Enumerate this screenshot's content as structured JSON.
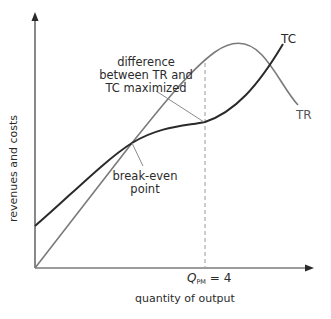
{
  "diagram": {
    "type": "economics-profit-maximization",
    "axes": {
      "y_label": "revenues and costs",
      "x_label": "quantity of output"
    },
    "curves": {
      "tc": {
        "label": "TC",
        "color": "#2a2a2a"
      },
      "tr": {
        "label": "TR",
        "color": "#7a7a7a"
      }
    },
    "annotations": {
      "max_diff": {
        "line1": "difference",
        "line2": "between TR and",
        "line3": "TC maximized"
      },
      "break_even": {
        "line1": "break-even",
        "line2": "point"
      },
      "q_marker": {
        "symbol": "Q",
        "subscript": "PM",
        "value_text": "= 4"
      }
    },
    "colors": {
      "axis": "#3a3a3a",
      "tc_curve": "#2a2a2a",
      "tr_curve": "#7a7a7a",
      "dashed_line": "#9a9a9a",
      "leader_lines": "#8a8a8a",
      "text": "#2b2b2b"
    }
  }
}
